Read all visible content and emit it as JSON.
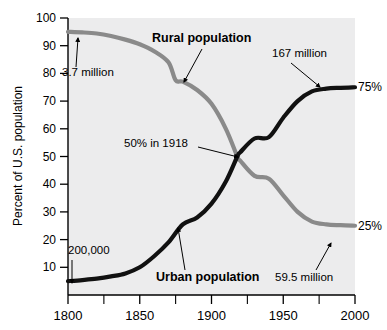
{
  "chart_data": {
    "type": "line",
    "title": "",
    "xlabel": "",
    "ylabel": "Percent of U.S. population",
    "xlim": [
      1800,
      2000
    ],
    "ylim": [
      0,
      100
    ],
    "grid": false,
    "legend_position": "inline-annotations",
    "xticks": [
      1800,
      1850,
      1900,
      1950,
      2000
    ],
    "xtick_labels": [
      "1800",
      "1850",
      "1900",
      "1950",
      "2000"
    ],
    "xminor_ticks": [
      1825,
      1875,
      1925,
      1975
    ],
    "yticks": [
      10,
      20,
      30,
      40,
      50,
      60,
      70,
      80,
      90,
      100
    ],
    "ytick_labels": [
      "10",
      "20",
      "30",
      "40",
      "50",
      "60",
      "70",
      "80",
      "90",
      "100"
    ],
    "series": [
      {
        "name": "Rural population",
        "color": "#8a8a8a",
        "x": [
          1800,
          1810,
          1820,
          1830,
          1840,
          1850,
          1860,
          1870,
          1875,
          1880,
          1890,
          1900,
          1910,
          1918,
          1920,
          1930,
          1940,
          1950,
          1960,
          1970,
          1980,
          1990,
          2000
        ],
        "values": [
          95.0,
          94.8,
          94.4,
          93.5,
          92.2,
          90.5,
          88.0,
          84.0,
          77.5,
          77.0,
          74.0,
          69.0,
          60.0,
          50.0,
          48.5,
          43.0,
          42.0,
          36.0,
          30.0,
          26.5,
          25.5,
          25.2,
          25.0
        ]
      },
      {
        "name": "Urban population",
        "color": "#111111",
        "x": [
          1800,
          1810,
          1820,
          1830,
          1840,
          1850,
          1860,
          1870,
          1880,
          1890,
          1900,
          1910,
          1918,
          1920,
          1930,
          1940,
          1950,
          1960,
          1970,
          1980,
          1990,
          2000
        ],
        "values": [
          5.0,
          5.4,
          5.9,
          6.7,
          7.8,
          10.0,
          14.0,
          19.0,
          25.5,
          28.0,
          33.0,
          41.0,
          50.0,
          51.5,
          56.5,
          57.0,
          64.0,
          70.0,
          73.5,
          74.5,
          74.8,
          75.0
        ]
      }
    ],
    "annotations": [
      {
        "id": "rural-start-value",
        "text": "3.7 million",
        "target_series": "Rural population",
        "target_x": 1800,
        "target_y": 95
      },
      {
        "id": "rural-series-label",
        "text": "Rural population",
        "target_series": "Rural population",
        "target_x": 1875,
        "target_y": 77.5
      },
      {
        "id": "urban-start-value",
        "text": "200,000",
        "target_series": "Urban population",
        "target_x": 1800,
        "target_y": 5
      },
      {
        "id": "urban-series-label",
        "text": "Urban population",
        "target_series": "Urban population",
        "target_x": 1880,
        "target_y": 25.5
      },
      {
        "id": "crossover-label",
        "text": "50% in 1918",
        "target_series": "crossover",
        "target_x": 1918,
        "target_y": 50
      },
      {
        "id": "urban-end-value",
        "text": "167 million",
        "target_series": "Urban population",
        "target_x": 1975,
        "target_y": 74.5
      },
      {
        "id": "rural-end-value",
        "text": "59.5 million",
        "target_series": "Rural population",
        "target_x": 1982,
        "target_y": 25.4
      }
    ],
    "endpoint_labels": [
      {
        "id": "urban-endpoint-pct",
        "text": "75%",
        "series": "Urban population",
        "value": 75
      },
      {
        "id": "rural-endpoint-pct",
        "text": "25%",
        "series": "Rural population",
        "value": 25
      }
    ],
    "colors": {
      "plot_background": "#ececed",
      "rural_line": "#8a8a8a",
      "urban_line": "#111111",
      "axis": "#000000",
      "page_background": "#ffffff"
    }
  }
}
